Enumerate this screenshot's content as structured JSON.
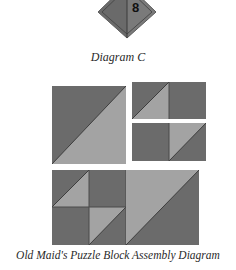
{
  "diamond": {
    "label": "8",
    "colors": {
      "dark": "#6e6e6e",
      "light": "#8c8c8c",
      "outline": "#4a4a4a"
    }
  },
  "captions": {
    "diagram_c": "Diagram C",
    "assembly": "Old Maid's Puzzle Block Assembly Diagram"
  },
  "colors": {
    "dark_fabric": "#6b6b6b",
    "light_fabric": "#a3a3a3",
    "seam": "#3e3e3e",
    "background": "#ffffff"
  },
  "blocks": {
    "large_hst": {
      "description": "Large half-square triangle, dark upper-left, light lower-right"
    },
    "small_unit_top": {
      "description": "Half-square triangle unit + dark square"
    },
    "small_unit_bottom": {
      "description": "Dark square + half-square triangle unit"
    },
    "bottom_row": {
      "description": "Four-patch of triangles joined to large half-square triangle"
    }
  }
}
